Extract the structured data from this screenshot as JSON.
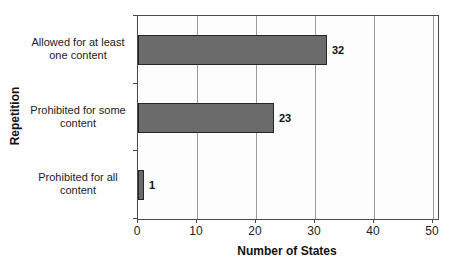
{
  "chart_data": {
    "type": "bar",
    "orientation": "horizontal",
    "title": "",
    "categories": [
      "Allowed for at least one content",
      "Prohibited for some content",
      "Prohibited for all content"
    ],
    "values": [
      32,
      23,
      1
    ],
    "xlabel": "Number of States",
    "ylabel": "Repetition",
    "xlim": [
      0,
      50
    ],
    "xticks": [
      0,
      10,
      20,
      30,
      40,
      50
    ],
    "grid": "vertical-gridlines",
    "legend": "none",
    "bar_color": "#6b6b6b",
    "bar_border_color": "#262626",
    "gridline_color": "#9b9b9b"
  }
}
